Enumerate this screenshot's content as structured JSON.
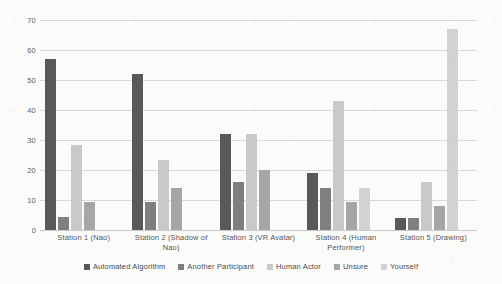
{
  "chart_data": {
    "type": "bar",
    "title": "",
    "xlabel": "",
    "ylabel": "",
    "ylim": [
      0,
      70
    ],
    "ytick_step": 10,
    "yticks": [
      70,
      60,
      50,
      40,
      30,
      20,
      10,
      0
    ],
    "grid": true,
    "legend_position": "bottom",
    "categories": [
      "Station 1 (Nao)",
      "Station 2 (Shadow of Nao)",
      "Station 3 (VR Avatar)",
      "Station 4 (Human Performer)",
      "Station 5 (Drawing)"
    ],
    "series": [
      {
        "name": "Automated Algorithm",
        "color": "#595959",
        "values": [
          57,
          52,
          32,
          19,
          4
        ]
      },
      {
        "name": "Another Participant",
        "color": "#7f7f7f",
        "values": [
          4.5,
          9.5,
          16,
          14,
          4
        ]
      },
      {
        "name": "Human Actor",
        "color": "#c9c9c9",
        "values": [
          28.5,
          23.5,
          32,
          43,
          16
        ]
      },
      {
        "name": "Unsure",
        "color": "#a6a6a6",
        "values": [
          9.5,
          14,
          20,
          9.5,
          8
        ]
      },
      {
        "name": "Yourself",
        "color": "#d2d2d2",
        "values": [
          0,
          0,
          0,
          14,
          67
        ]
      }
    ]
  },
  "axis": {
    "y_tick_labels": [
      "70",
      "60",
      "50",
      "40",
      "30",
      "20",
      "10",
      "0"
    ]
  },
  "legend": {
    "items": [
      {
        "label": "Automated Algorithm",
        "color": "#595959"
      },
      {
        "label": "Another Participant",
        "color": "#7f7f7f"
      },
      {
        "label": "Human Actor",
        "color": "#c9c9c9"
      },
      {
        "label": "Unsure",
        "color": "#a6a6a6"
      },
      {
        "label": "Yourself",
        "color": "#d2d2d2"
      }
    ]
  },
  "colors": {
    "background": "#fbfbfa",
    "gridline": "#d8d8d8",
    "axis_text": "#5d5d5d",
    "label_text": "#555555"
  }
}
